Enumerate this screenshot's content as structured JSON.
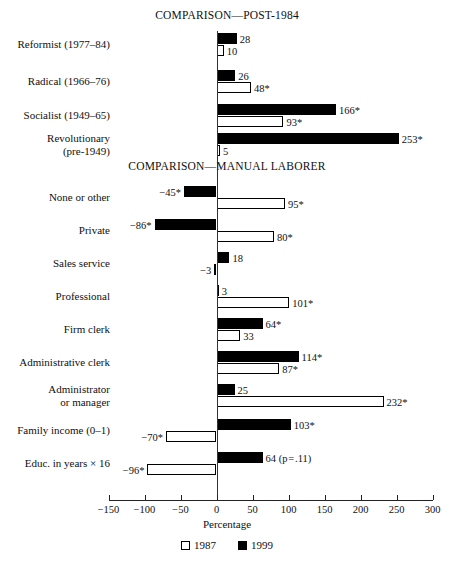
{
  "axis": {
    "xlabel": "Percentage",
    "ticks": [
      -150,
      -100,
      -50,
      0,
      50,
      100,
      150,
      200,
      250,
      300
    ],
    "tick_labels": [
      "−150",
      "−100",
      "−50",
      "0",
      "50",
      "100",
      "150",
      "200",
      "250",
      "300"
    ]
  },
  "legend": {
    "items": [
      {
        "label": "1987",
        "style": "light"
      },
      {
        "label": "1999",
        "style": "dark"
      }
    ]
  },
  "sections": [
    {
      "title": "COMPARISON—POST-1984",
      "rows": [
        {
          "label": "Reformist (1977–84)",
          "dark": {
            "value": 28,
            "text": "28"
          },
          "light": {
            "value": 10,
            "text": "10"
          }
        },
        {
          "label": "Radical (1966–76)",
          "dark": {
            "value": 26,
            "text": "26"
          },
          "light": {
            "value": 48,
            "text": "48*"
          }
        },
        {
          "label": "Socialist (1949–65)",
          "dark": {
            "value": 166,
            "text": "166*"
          },
          "light": {
            "value": 93,
            "text": "93*"
          }
        },
        {
          "label": "Revolutionary\n(pre-1949)",
          "dark": {
            "value": 253,
            "text": "253*"
          },
          "light": {
            "value": 5,
            "text": "5"
          }
        }
      ]
    },
    {
      "title": "COMPARISON—MANUAL LABORER",
      "rows": [
        {
          "label": "None or other",
          "dark": {
            "value": -45,
            "text": "−45*"
          },
          "light": {
            "value": 95,
            "text": "95*"
          }
        },
        {
          "label": "Private",
          "dark": {
            "value": -86,
            "text": "−86*"
          },
          "light": {
            "value": 80,
            "text": "80*"
          }
        },
        {
          "label": "Sales service",
          "dark": {
            "value": 18,
            "text": "18"
          },
          "light": {
            "value": -3,
            "text": "−3"
          }
        },
        {
          "label": "Professional",
          "dark": {
            "value": 3,
            "text": "3"
          },
          "light": {
            "value": 101,
            "text": "101*"
          }
        },
        {
          "label": "Firm clerk",
          "dark": {
            "value": 64,
            "text": "64*"
          },
          "light": {
            "value": 33,
            "text": "33"
          }
        },
        {
          "label": "Administrative clerk",
          "dark": {
            "value": 114,
            "text": "114*"
          },
          "light": {
            "value": 87,
            "text": "87*"
          }
        },
        {
          "label": "Administrator\nor manager",
          "dark": {
            "value": 25,
            "text": "25"
          },
          "light": {
            "value": 232,
            "text": "232*"
          }
        },
        {
          "label": "Family income (0–1)",
          "dark": {
            "value": 103,
            "text": "103*"
          },
          "light": {
            "value": -70,
            "text": "−70*"
          }
        },
        {
          "label": "Educ. in years × 16",
          "dark": {
            "value": 64,
            "text": "64 (p = .11)"
          },
          "light": {
            "value": -96,
            "text": "−96*"
          }
        }
      ]
    }
  ],
  "chart_data": {
    "type": "bar",
    "xlabel": "Percentage",
    "ylabel": "",
    "xlim": [
      -150,
      300
    ],
    "grid": false,
    "legend_position": "bottom",
    "orientation": "horizontal",
    "series": [
      {
        "name": "1987",
        "style": "light",
        "values": [
          10,
          48,
          93,
          5,
          95,
          80,
          -3,
          101,
          33,
          87,
          232,
          -70,
          -96
        ]
      },
      {
        "name": "1999",
        "style": "dark",
        "values": [
          28,
          26,
          166,
          253,
          -45,
          -86,
          18,
          3,
          64,
          114,
          25,
          103,
          64
        ]
      }
    ],
    "categories": [
      "Reformist (1977–84)",
      "Radical (1966–76)",
      "Socialist (1949–65)",
      "Revolutionary (pre-1949)",
      "None or other",
      "Private",
      "Sales service",
      "Professional",
      "Firm clerk",
      "Administrative clerk",
      "Administrator or manager",
      "Family income (0–1)",
      "Educ. in years × 16"
    ],
    "annotations": [
      "* denotes statistical significance",
      "Educ. in years × 16 (1999) labeled 64 (p = .11)"
    ],
    "panels": [
      {
        "title": "COMPARISON—POST-1984",
        "categories": [
          "Reformist (1977–84)",
          "Radical (1966–76)",
          "Socialist (1949–65)",
          "Revolutionary (pre-1949)"
        ]
      },
      {
        "title": "COMPARISON—MANUAL LABORER",
        "categories": [
          "None or other",
          "Private",
          "Sales service",
          "Professional",
          "Firm clerk",
          "Administrative clerk",
          "Administrator or manager",
          "Family income (0–1)",
          "Educ. in years × 16"
        ]
      }
    ]
  }
}
